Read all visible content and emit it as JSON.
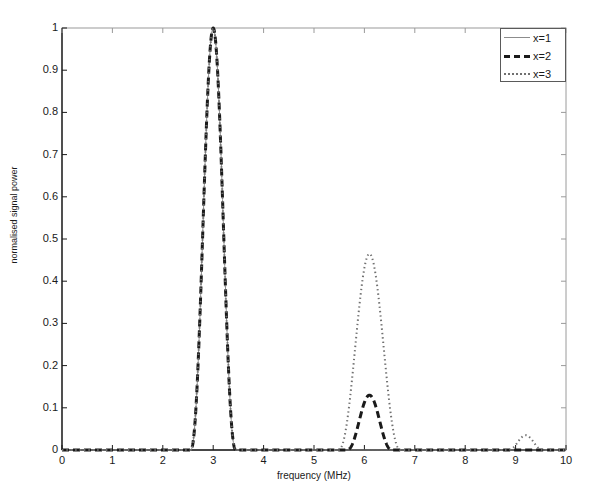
{
  "chart_data": {
    "type": "line",
    "title": "",
    "xlabel": "frequency (MHz)",
    "ylabel": "normalised signal power",
    "xlim": [
      0,
      10
    ],
    "ylim": [
      0,
      1
    ],
    "xticks": [
      "0",
      "1",
      "2",
      "3",
      "4",
      "5",
      "6",
      "7",
      "8",
      "9",
      "10"
    ],
    "yticks": [
      "0",
      "0.1",
      "0.2",
      "0.3",
      "0.4",
      "0.5",
      "0.6",
      "0.7",
      "0.8",
      "0.9",
      "1"
    ],
    "grid": false,
    "legend_position": "top-right",
    "series": [
      {
        "name": "x=1",
        "style": "solid",
        "color": "#8c8c8c",
        "peaks": [
          {
            "center": 3.0,
            "amplitude": 1.0,
            "halfwidth": 0.45
          }
        ],
        "points_x": [
          0,
          2.5,
          2.55,
          2.7,
          2.85,
          3.0,
          3.15,
          3.3,
          3.45,
          3.5,
          10
        ],
        "points_y": [
          0,
          0,
          0.02,
          0.33,
          0.68,
          1.0,
          0.67,
          0.33,
          0.02,
          0,
          0
        ]
      },
      {
        "name": "x=2",
        "style": "dashed",
        "color": "#1a1a1a",
        "peaks": [
          {
            "center": 3.0,
            "amplitude": 1.0,
            "halfwidth": 0.45
          },
          {
            "center": 6.1,
            "amplitude": 0.13,
            "halfwidth": 0.45
          }
        ],
        "points_x": [
          0,
          2.5,
          2.55,
          2.7,
          2.85,
          3.0,
          3.15,
          3.3,
          3.45,
          3.5,
          5.6,
          5.7,
          5.9,
          6.1,
          6.3,
          6.5,
          6.6,
          10
        ],
        "points_y": [
          0,
          0,
          0.02,
          0.33,
          0.68,
          1.0,
          0.67,
          0.33,
          0.02,
          0,
          0,
          0.015,
          0.08,
          0.13,
          0.08,
          0.015,
          0,
          0
        ]
      },
      {
        "name": "x=3",
        "style": "dotted",
        "color": "#707070",
        "peaks": [
          {
            "center": 3.0,
            "amplitude": 1.0,
            "halfwidth": 0.45
          },
          {
            "center": 6.1,
            "amplitude": 0.465,
            "halfwidth": 0.62
          },
          {
            "center": 9.2,
            "amplitude": 0.035,
            "halfwidth": 0.35
          }
        ],
        "points_x": [
          0,
          2.5,
          2.55,
          2.7,
          2.85,
          3.0,
          3.15,
          3.3,
          3.45,
          3.5,
          5.35,
          5.5,
          5.75,
          6.0,
          6.1,
          6.25,
          6.5,
          6.7,
          6.85,
          8.85,
          9.0,
          9.2,
          9.4,
          9.55,
          10
        ],
        "points_y": [
          0,
          0,
          0.02,
          0.33,
          0.68,
          1.0,
          0.67,
          0.33,
          0.02,
          0,
          0,
          0.03,
          0.2,
          0.43,
          0.465,
          0.4,
          0.19,
          0.04,
          0,
          0,
          0.012,
          0.035,
          0.012,
          0,
          0
        ]
      }
    ]
  },
  "legend": {
    "items": [
      {
        "label": "x=1"
      },
      {
        "label": "x=2"
      },
      {
        "label": "x=3"
      }
    ]
  },
  "axes": {
    "x_label": "frequency (MHz)",
    "y_label": "normalised signal power"
  }
}
